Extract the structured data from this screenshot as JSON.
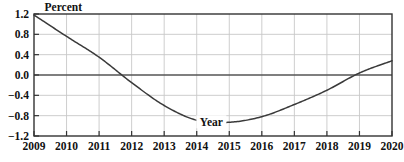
{
  "chart_data": {
    "type": "line",
    "title": "",
    "subtitle": "",
    "xlabel": "Year",
    "ylabel": "Percent",
    "xlim": [
      2009,
      2020
    ],
    "ylim": [
      -1.2,
      1.2
    ],
    "yticks": [
      "1.2",
      "0.8",
      "0.4",
      "0.0",
      "-0.4",
      "-0.8",
      "-1.2"
    ],
    "ytick_values": [
      1.2,
      0.8,
      0.4,
      0.0,
      -0.4,
      -0.8,
      -1.2
    ],
    "xticks": [
      "2009",
      "2010",
      "2011",
      "2012",
      "2013",
      "2014",
      "2015",
      "2016",
      "2017",
      "2018",
      "2019",
      "2020"
    ],
    "xtick_values": [
      2009,
      2010,
      2011,
      2012,
      2013,
      2014,
      2015,
      2016,
      2017,
      2018,
      2019,
      2020
    ],
    "grid": true,
    "legend": "none",
    "zero_line": true,
    "x": [
      2009,
      2010,
      2011,
      2012,
      2013,
      2014,
      2015,
      2016,
      2017,
      2018,
      2019,
      2020
    ],
    "values": [
      1.18,
      0.76,
      0.35,
      -0.15,
      -0.6,
      -0.89,
      -0.93,
      -0.82,
      -0.58,
      -0.3,
      0.04,
      0.28
    ],
    "series": [
      {
        "name": "Percent",
        "values": [
          1.18,
          0.76,
          0.35,
          -0.15,
          -0.6,
          -0.89,
          -0.93,
          -0.82,
          -0.58,
          -0.3,
          0.04,
          0.28
        ]
      }
    ],
    "annotations": [
      {
        "text": "Year",
        "x": 2014.45,
        "y": -0.93
      },
      {
        "text": "Percent",
        "x": 2009.2,
        "y": 1.32
      }
    ],
    "zero_crossings": [
      2011.6,
      2018.8
    ],
    "minimum": {
      "x": 2014.6,
      "y": -0.93
    },
    "colors": {
      "line": "#3a3a3a",
      "axis": "#333333",
      "grid": "#c8c8c8",
      "zero_line": "#555555",
      "background": "#ffffff"
    }
  }
}
